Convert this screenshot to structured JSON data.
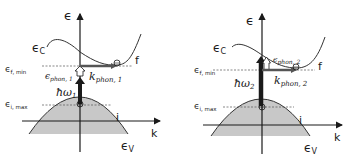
{
  "panels": [
    {
      "id": "panel-1",
      "axis_y_label": "ϵ",
      "axis_x_label": "k",
      "conduction_label": "ϵ",
      "conduction_sub": "C",
      "valence_label": "ϵ",
      "valence_sub": "V",
      "final_state_label": "f",
      "initial_state_label": "i",
      "f_min_label": "ϵ",
      "f_min_sub": "f, min",
      "i_max_label": "ϵ",
      "i_max_sub": "i, max",
      "photon_label": "ħω",
      "photon_sub": "1",
      "phonon_energy_label": "ϵ",
      "phonon_energy_sub": "phon, 1",
      "phonon_k_label": "k",
      "phonon_k_sub": "phon, 1"
    },
    {
      "id": "panel-2",
      "axis_y_label": "ϵ",
      "axis_x_label": "k",
      "conduction_label": "ϵ",
      "conduction_sub": "C",
      "valence_label": "ϵ",
      "valence_sub": "V",
      "final_state_label": "f",
      "initial_state_label": "i",
      "f_min_label": "ϵ",
      "f_min_sub": "f, min",
      "i_max_label": "ϵ",
      "i_max_sub": "i, max",
      "photon_label": "ħω",
      "photon_sub": "2",
      "phonon_energy_label": "ϵ",
      "phonon_energy_sub": "phon, 2",
      "phonon_k_label": "k",
      "phonon_k_sub": "phon, 2"
    }
  ],
  "colors": {
    "line": "#1a1a1a",
    "valence_fill": "#c8c8c8",
    "curve": "#333333",
    "dashed": "#555555"
  }
}
